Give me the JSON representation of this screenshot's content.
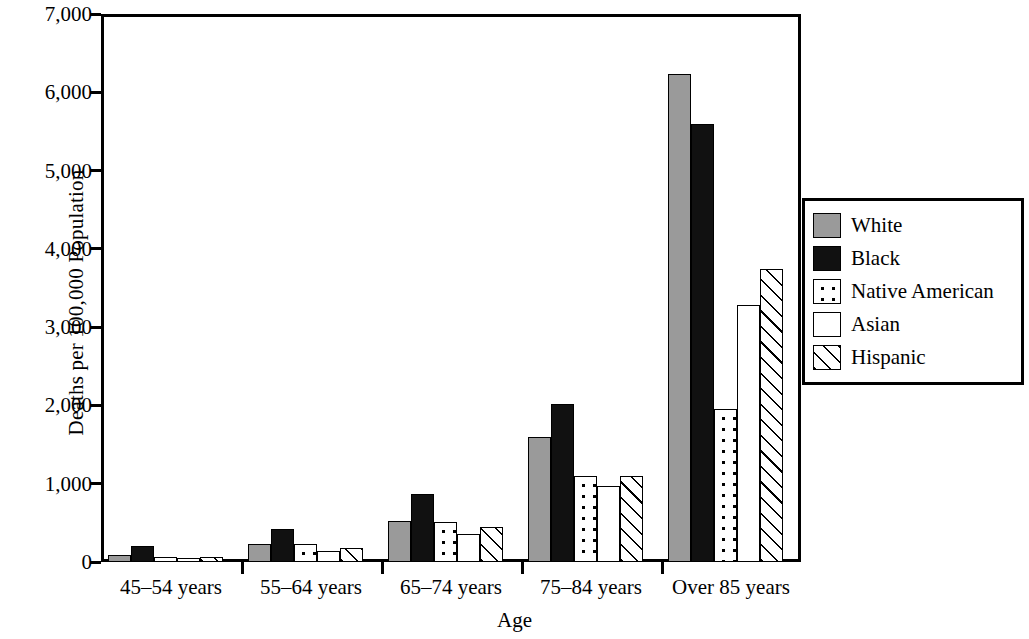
{
  "chart_data": {
    "type": "bar",
    "title": "",
    "xlabel": "Age",
    "ylabel": "Deaths per 100,000 Population",
    "categories": [
      "45–54 years",
      "55–64 years",
      "65–74 years",
      "75–84 years",
      "Over 85 years"
    ],
    "series": [
      {
        "name": "White",
        "values": [
          90,
          230,
          520,
          1600,
          6230
        ]
      },
      {
        "name": "Black",
        "values": [
          200,
          420,
          870,
          2020,
          5600
        ]
      },
      {
        "name": "Native American",
        "values": [
          70,
          230,
          510,
          1100,
          1950
        ]
      },
      {
        "name": "Asian",
        "values": [
          50,
          140,
          360,
          970,
          3280
        ]
      },
      {
        "name": "Hispanic",
        "values": [
          70,
          180,
          450,
          1100,
          3740
        ]
      }
    ],
    "ylim": [
      0,
      7000
    ],
    "yticks": [
      0,
      1000,
      2000,
      3000,
      4000,
      5000,
      6000,
      7000
    ],
    "ytick_labels": [
      "0",
      "1,000",
      "2,000",
      "3,000",
      "4,000",
      "5,000",
      "6,000",
      "7,000"
    ],
    "grid": false,
    "legend_position": "right"
  },
  "legend": {
    "entries": [
      {
        "label": "White",
        "pattern": "solid-gray",
        "color": "#9a9a9a"
      },
      {
        "label": "Black",
        "pattern": "solid-black",
        "color": "#111111"
      },
      {
        "label": "Native American",
        "pattern": "dotted",
        "color": "#ffffff"
      },
      {
        "label": "Asian",
        "pattern": "plain-white",
        "color": "#ffffff"
      },
      {
        "label": "Hispanic",
        "pattern": "diagonal-hatch",
        "color": "#ffffff"
      }
    ]
  }
}
